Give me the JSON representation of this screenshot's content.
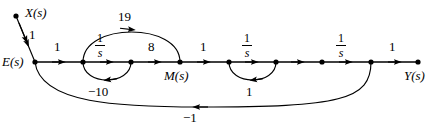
{
  "figure": {
    "type": "signal-flow-graph",
    "background_color": "#ffffff",
    "line_color": "#000000"
  },
  "nodes": [
    {
      "id": "X",
      "label": "X(s)",
      "x": 16,
      "y": 16,
      "label_dx": 8,
      "label_dy": -12,
      "terminal": true
    },
    {
      "id": "E",
      "label": "E(s)",
      "x": 35,
      "y": 62,
      "label_dx": -33,
      "label_dy": -7,
      "terminal": false
    },
    {
      "id": "n1",
      "label": "",
      "x": 83,
      "y": 62,
      "label_dx": 0,
      "label_dy": 0,
      "terminal": false
    },
    {
      "id": "n2",
      "label": "",
      "x": 131,
      "y": 62,
      "label_dx": 0,
      "label_dy": 0,
      "terminal": false
    },
    {
      "id": "M",
      "label": "M(s)",
      "x": 180,
      "y": 62,
      "label_dx": -17,
      "label_dy": 10,
      "terminal": false
    },
    {
      "id": "n3",
      "label": "",
      "x": 229,
      "y": 62,
      "label_dx": 0,
      "label_dy": 0,
      "terminal": false
    },
    {
      "id": "n4",
      "label": "",
      "x": 276,
      "y": 62,
      "label_dx": 0,
      "label_dy": 0,
      "terminal": false
    },
    {
      "id": "n5",
      "label": "",
      "x": 322,
      "y": 62,
      "label_dx": 0,
      "label_dy": 0,
      "terminal": false
    },
    {
      "id": "n6",
      "label": "",
      "x": 371,
      "y": 62,
      "label_dx": 0,
      "label_dy": 0,
      "terminal": false
    },
    {
      "id": "Y",
      "label": "Y(s)",
      "x": 418,
      "y": 62,
      "label_dx": -14,
      "label_dy": 12,
      "terminal": true
    }
  ],
  "branches": [
    {
      "id": "b-x-e",
      "from": "X",
      "to": "E",
      "gain": "1",
      "kind": "straight-slant",
      "label_x": 31,
      "label_y": 34
    },
    {
      "id": "b-e-n1",
      "from": "E",
      "to": "n1",
      "gain": "1",
      "kind": "straight",
      "label_x": 54,
      "label_y": 45
    },
    {
      "id": "b-n1-n2",
      "from": "n1",
      "to": "n2",
      "gain": "1/s",
      "kind": "straight-frac",
      "label_x": 100,
      "label_y": 39
    },
    {
      "id": "b-n2-m",
      "from": "n2",
      "to": "M",
      "gain": "8",
      "kind": "straight",
      "label_x": 150,
      "label_y": 45
    },
    {
      "id": "b-m-n3",
      "from": "M",
      "to": "n3",
      "gain": "1",
      "kind": "straight",
      "label_x": 201,
      "label_y": 45
    },
    {
      "id": "b-n3-n4",
      "from": "n3",
      "to": "n4",
      "gain": "1/s",
      "kind": "straight-frac",
      "label_x": 246,
      "label_y": 39
    },
    {
      "id": "b-n4-n5",
      "from": "n4",
      "to": "n5",
      "gain": "",
      "kind": "straight",
      "label_x": 0,
      "label_y": 0
    },
    {
      "id": "b-n5-n6",
      "from": "n5",
      "to": "n6",
      "gain": "1/s",
      "kind": "straight-frac",
      "label_x": 340,
      "label_y": 39
    },
    {
      "id": "b-n6-y",
      "from": "n6",
      "to": "Y",
      "gain": "1",
      "kind": "straight",
      "label_x": 392,
      "label_y": 45
    },
    {
      "id": "b-fb19",
      "from": "n1",
      "to": "M",
      "gain": "19",
      "kind": "arc-above",
      "label_x": 124,
      "label_y": 16
    },
    {
      "id": "b-fb10",
      "from": "n2",
      "to": "n1",
      "gain": "-10",
      "kind": "arc-below",
      "label_x": 95,
      "label_y": 84
    },
    {
      "id": "b-fb1",
      "from": "n4",
      "to": "n3",
      "gain": "1",
      "kind": "arc-below",
      "label_x": 249,
      "label_y": 84
    },
    {
      "id": "b-fbm1",
      "from": "n6",
      "to": "E",
      "gain": "-1",
      "kind": "arc-long-below",
      "label_x": 188,
      "label_y": 113
    }
  ],
  "labels": {
    "x_input": "X(s)",
    "e_node": "E(s)",
    "m_node": "M(s)",
    "y_output": "Y(s)",
    "gain_x_e": "1",
    "gain_e_n1": "1",
    "gain_n1_n2_num": "1",
    "gain_n1_n2_den": "s",
    "gain_n2_m": "8",
    "gain_m_n3": "1",
    "gain_n3_n4_num": "1",
    "gain_n3_n4_den": "s",
    "gain_n5_n6_num": "1",
    "gain_n5_n6_den": "s",
    "gain_n6_y": "1",
    "gain_loop19": "19",
    "gain_loop_neg10": "−10",
    "gain_loop_one": "1",
    "gain_feedback_neg1": "−1"
  }
}
